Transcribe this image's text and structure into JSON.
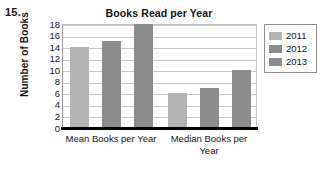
{
  "question_number": "15.",
  "chart_data": {
    "type": "bar",
    "title": "Books Read per Year",
    "xlabel": "",
    "ylabel": "Number of Books",
    "categories": [
      "Mean Books per Year",
      "Median Books per Year"
    ],
    "series": [
      {
        "name": "2011",
        "values": [
          14,
          6
        ],
        "color": "#b4b4b4"
      },
      {
        "name": "2012",
        "values": [
          15,
          7
        ],
        "color": "#8c8c8c"
      },
      {
        "name": "2013",
        "values": [
          18,
          10
        ],
        "color": "#8c8c8c"
      }
    ],
    "ylim": [
      0,
      18
    ],
    "yticks": [
      0,
      2,
      4,
      6,
      8,
      10,
      12,
      14,
      16,
      18
    ],
    "ytick_labels": [
      "0",
      "2",
      "4",
      "6",
      "8",
      "10",
      "12",
      "14",
      "16",
      "18"
    ],
    "grid": true,
    "grid_axis": "y",
    "legend_position": "right",
    "legend_entries": [
      "2011",
      "2012",
      "2013"
    ],
    "bar_mode": "grouped"
  },
  "colors": {
    "plot_background": "#ffffff",
    "gridline": "#c9c9c9",
    "baseline": "#000000",
    "text": "#161616",
    "legend_border": "#8e8e8e"
  }
}
